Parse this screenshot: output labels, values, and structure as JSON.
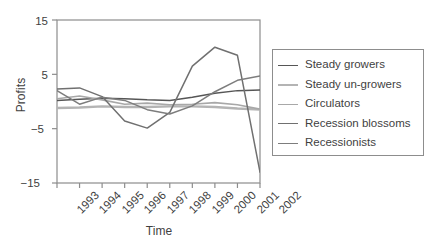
{
  "chart_data": {
    "type": "line",
    "title": "",
    "xlabel": "Time",
    "ylabel": "Profits",
    "categories": [
      "1993",
      "1994",
      "1995",
      "1996",
      "1997",
      "1998",
      "1999",
      "2000",
      "2001",
      "2002"
    ],
    "x": [
      1993,
      1994,
      1995,
      1996,
      1997,
      1998,
      1999,
      2000,
      2001,
      2002
    ],
    "xlim": [
      1993,
      2002
    ],
    "ylim": [
      -15,
      15
    ],
    "yticks": [
      15,
      5,
      -5,
      -15
    ],
    "ytick_labels": [
      "15",
      "5",
      "−5",
      "−15"
    ],
    "grid": false,
    "legend_position": "right-outside",
    "series": [
      {
        "name": "Steady growers",
        "color": "#565656",
        "width": 1.5,
        "values": [
          0.2,
          0.4,
          0.6,
          0.5,
          0.3,
          0.2,
          0.8,
          1.5,
          2.0,
          2.1
        ]
      },
      {
        "name": "Steady un-growers",
        "color": "#b4b4b4",
        "width": 2.4,
        "values": [
          -1.2,
          -1.1,
          -0.9,
          -1.0,
          -1.0,
          -0.9,
          -0.9,
          -1.0,
          -1.3,
          -1.5
        ]
      },
      {
        "name": "Circulators",
        "color": "#a8a8a8",
        "width": 1.6,
        "values": [
          0.5,
          1.0,
          0.3,
          -0.5,
          -0.3,
          -0.6,
          -0.5,
          -0.2,
          -0.6,
          -1.4
        ]
      },
      {
        "name": "Recession blossoms",
        "color": "#707070",
        "width": 1.5,
        "values": [
          2.3,
          2.5,
          0.9,
          -3.6,
          -4.9,
          -2.0,
          6.5,
          10.0,
          8.5,
          -13.0
        ]
      },
      {
        "name": "Recessionists",
        "color": "#7d7d7d",
        "width": 1.5,
        "values": [
          2.0,
          -0.5,
          0.8,
          0.2,
          -1.5,
          -2.3,
          -0.8,
          1.8,
          3.9,
          4.7
        ]
      }
    ]
  },
  "axes": {
    "ylabel": "Profits",
    "xlabel": "Time",
    "ytick_labels": [
      "15",
      "5",
      "−5",
      "−15"
    ],
    "xtick_labels": [
      "1993",
      "1994",
      "1995",
      "1996",
      "1997",
      "1998",
      "1999",
      "2000",
      "2001",
      "2002"
    ]
  },
  "legend": {
    "entries": [
      {
        "label": "Steady growers",
        "color": "#565656"
      },
      {
        "label": "Steady un-growers",
        "color": "#b4b4b4"
      },
      {
        "label": "Circulators",
        "color": "#a8a8a8"
      },
      {
        "label": "Recession blossoms",
        "color": "#707070"
      },
      {
        "label": "Recessionists",
        "color": "#7d7d7d"
      }
    ]
  },
  "style": {
    "axis_color": "#8d8d8d",
    "text_color": "#3f3f3f",
    "background": "#ffffff"
  }
}
